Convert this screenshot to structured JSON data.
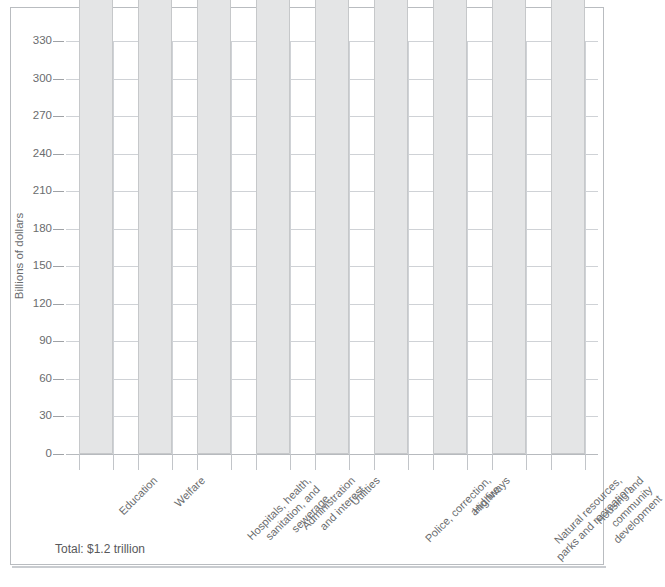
{
  "chart_data": {
    "type": "bar",
    "title": "",
    "xlabel": "",
    "ylabel": "Billions of dollars",
    "ylim": [
      0,
      330
    ],
    "ytick_step": 30,
    "yticks": [
      330,
      300,
      270,
      240,
      210,
      180,
      150,
      120,
      90,
      60,
      30,
      0
    ],
    "grid": "both",
    "legend": "none",
    "units": "billions of dollars",
    "categories": [
      "Education",
      "Welfare",
      "Hospitals, health,\nsanitation, and\nsewerage",
      "Administration\nand interest",
      "Utilities",
      "Police, correction,\nand fire",
      "Highways",
      "Natural resources,\nparks and recreation",
      "Housing and\ncommunity\ndevelopment"
    ],
    "values": [
      326769,
      154235,
      120510,
      105590,
      81298,
      77509,
      66477,
      28777,
      17067
    ],
    "value_labels": [
      "326,769",
      "154,235",
      "120,510",
      "105,590",
      "81,298",
      "77,509",
      "66,477",
      "28,777",
      "17,067"
    ],
    "annotations": [
      "Total: $1.2 trillion"
    ],
    "colors": {
      "bar_fill": "#e4e5e6",
      "bar_stroke": "#c6c8ca",
      "grid": "#cfd2d6",
      "text": "#6a6c6e",
      "frame": "#b9bcc0"
    }
  },
  "caption": {
    "total": "Total: $1.2 trillion"
  },
  "axis": {
    "y_title": "Billions of dollars"
  }
}
